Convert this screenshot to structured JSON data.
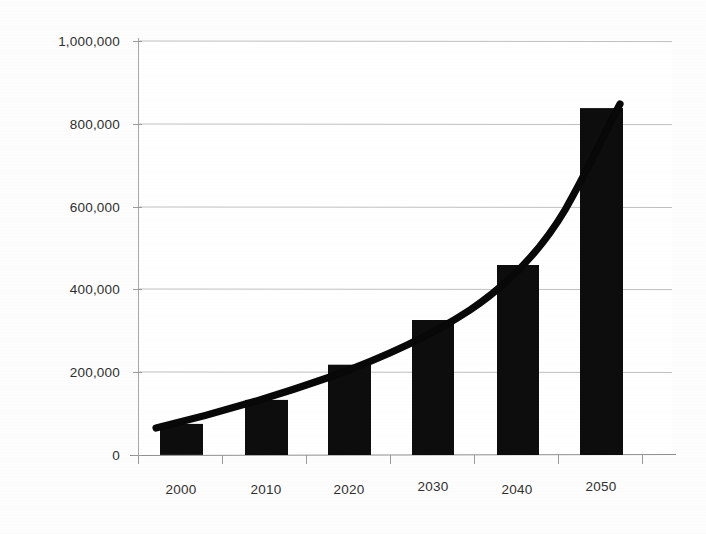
{
  "chart_data": {
    "type": "bar",
    "title": "",
    "subtitle": "",
    "xlabel": "",
    "ylabel": "",
    "categories": [
      "2000",
      "2010",
      "2020",
      "2030",
      "2040",
      "2050"
    ],
    "values": [
      75000,
      133000,
      218000,
      326000,
      459000,
      838000
    ],
    "series": [
      {
        "name": "Bars",
        "type": "bar",
        "values": [
          75000,
          133000,
          218000,
          326000,
          459000,
          838000
        ]
      },
      {
        "name": "Trend",
        "type": "line",
        "values": [
          70000,
          140000,
          225000,
          335000,
          450000,
          845000
        ]
      }
    ],
    "ylim": [
      0,
      1000000
    ],
    "ytick_values": [
      0,
      200000,
      400000,
      600000,
      800000,
      1000000
    ],
    "ytick_labels": [
      "0",
      "200,000",
      "400,000",
      "600,000",
      "800,000",
      "1,000,000"
    ],
    "xtick_labels": [
      "2000",
      "2010",
      "2020",
      "2030",
      "2040",
      "2050"
    ],
    "grid": true,
    "grid_axis": "y",
    "legend": false,
    "legend_position": "none",
    "bar_color": "#0d0d0d",
    "line_color": "#080808",
    "grid_color": "#b9b9b9",
    "background_color": "#ffffff",
    "annotations": []
  },
  "axes": {
    "y_labels": [
      {
        "text": "1,000,000",
        "value": 1000000,
        "y": 41
      },
      {
        "text": "800,000",
        "value": 800000,
        "y": 124
      },
      {
        "text": "600,000",
        "value": 600000,
        "y": 207
      },
      {
        "text": "400,000",
        "value": 400000,
        "y": 289
      },
      {
        "text": "200,000",
        "value": 200000,
        "y": 372
      },
      {
        "text": "0",
        "value": 0,
        "y": 455
      }
    ],
    "x_labels": [
      {
        "text": "2000",
        "x": 181
      },
      {
        "text": "2010",
        "x": 266
      },
      {
        "text": "2020",
        "x": 349
      },
      {
        "text": "2030",
        "x": 433
      },
      {
        "text": "2040",
        "x": 517
      },
      {
        "text": "2050",
        "x": 601
      }
    ]
  },
  "bars": [
    {
      "label": "2000",
      "value": 75000,
      "x": 160,
      "width": 43,
      "top": 424
    },
    {
      "label": "2010",
      "value": 133000,
      "x": 245,
      "width": 43,
      "top": 400
    },
    {
      "label": "2020",
      "value": 218000,
      "x": 328,
      "width": 43,
      "top": 365
    },
    {
      "label": "2030",
      "value": 326000,
      "x": 412,
      "width": 42,
      "top": 320
    },
    {
      "label": "2040",
      "value": 459000,
      "x": 497,
      "width": 42,
      "top": 265
    },
    {
      "label": "2050",
      "value": 838000,
      "x": 580,
      "width": 43,
      "top": 108
    }
  ]
}
